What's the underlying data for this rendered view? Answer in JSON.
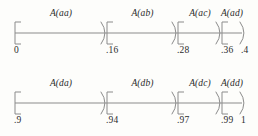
{
  "figure": {
    "background_color": "#fdfdfb",
    "stroke_color": "#8b8b8b",
    "text_color": "#2b2b2b"
  },
  "chart_data": {
    "type": "diagram",
    "subtype": "interval-subdivision-number-line",
    "title": "",
    "grid": false,
    "legend": null,
    "lines": [
      {
        "id": "top",
        "axis_range": [
          0,
          0.4
        ],
        "boundaries_text": [
          "0",
          ".16",
          ".28",
          ".36",
          ".4"
        ],
        "boundaries_value": [
          0,
          0.16,
          0.28,
          0.36,
          0.4
        ],
        "segments": [
          {
            "label": "A(aa)",
            "start_text": "0",
            "end_text": ".16",
            "start": 0,
            "end": 0.16
          },
          {
            "label": "A(ab)",
            "start_text": ".16",
            "end_text": ".28",
            "start": 0.16,
            "end": 0.28
          },
          {
            "label": "A(ac)",
            "start_text": ".28",
            "end_text": ".36",
            "start": 0.28,
            "end": 0.36
          },
          {
            "label": "A(ad)",
            "start_text": ".36",
            "end_text": ".4",
            "start": 0.36,
            "end": 0.4
          }
        ]
      },
      {
        "id": "bottom",
        "axis_range": [
          0.9,
          1.0
        ],
        "boundaries_text": [
          ".9",
          ".94",
          ".97",
          ".99",
          "1"
        ],
        "boundaries_value": [
          0.9,
          0.94,
          0.97,
          0.99,
          1.0
        ],
        "segments": [
          {
            "label": "A(da)",
            "start_text": ".9",
            "end_text": ".94",
            "start": 0.9,
            "end": 0.94
          },
          {
            "label": "A(db)",
            "start_text": ".94",
            "end_text": ".97",
            "start": 0.94,
            "end": 0.97
          },
          {
            "label": "A(dc)",
            "start_text": ".97",
            "end_text": ".99",
            "start": 0.97,
            "end": 0.99
          },
          {
            "label": "A(dd)",
            "start_text": ".99",
            "end_text": "1",
            "start": 0.99,
            "end": 1.0
          }
        ]
      }
    ]
  },
  "geometry": {
    "line_x_start": 15,
    "line_x_end": 242,
    "boundary_px": [
      15,
      107,
      178,
      222,
      242
    ],
    "top_line_top": 0,
    "bottom_line_top": 70,
    "axis_y": 33,
    "segment_label_y": 8,
    "tick_label_y": 45
  }
}
